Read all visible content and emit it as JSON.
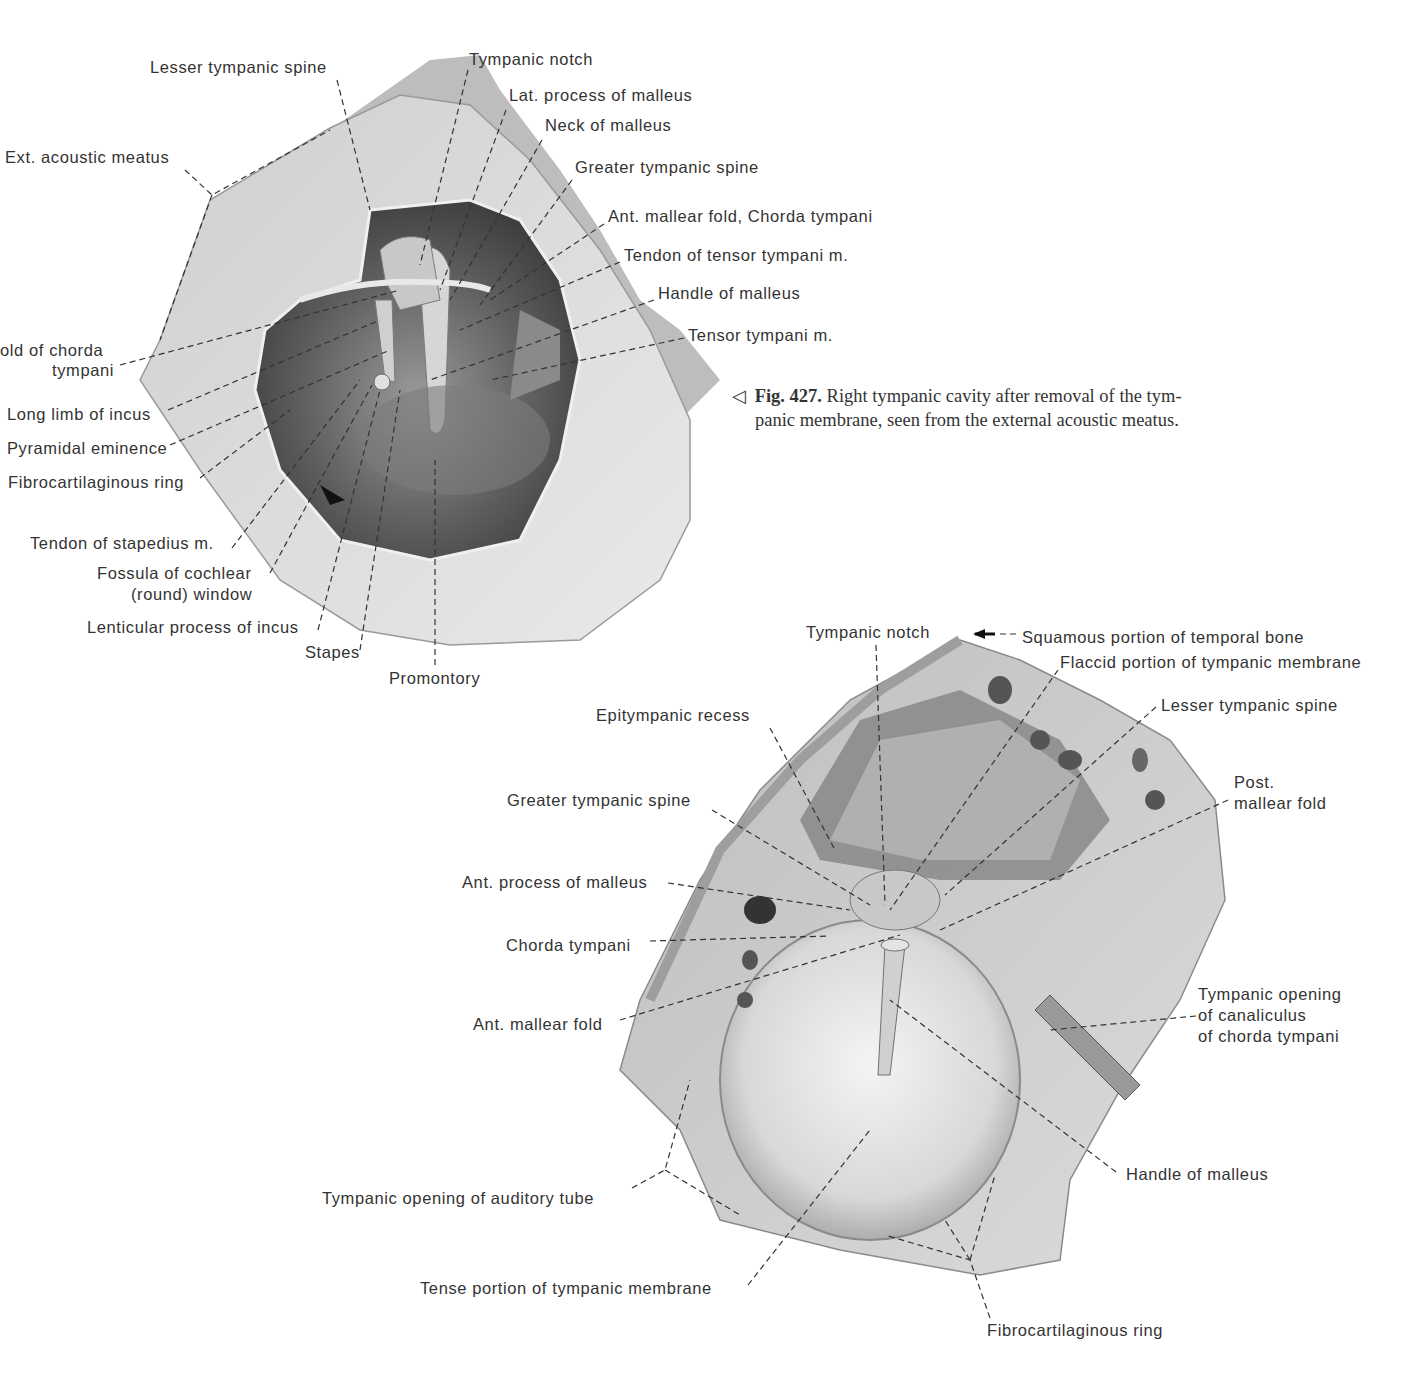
{
  "figure_caption": {
    "marker": "◁",
    "number": "Fig. 427.",
    "line1": "Right tympanic cavity after removal of the tym-",
    "line2": "panic membrane, seen from the external acoustic meatus."
  },
  "figure_top": {
    "title": "Right tympanic cavity (tympanic membrane removed)",
    "labels": [
      {
        "id": "lesser-tympanic-spine",
        "text": "Lesser tympanic spine",
        "x": 150,
        "y": 57
      },
      {
        "id": "tympanic-notch",
        "text": "Tympanic notch",
        "x": 469,
        "y": 49
      },
      {
        "id": "lat-process-malleus",
        "text": "Lat. process of malleus",
        "x": 509,
        "y": 85
      },
      {
        "id": "neck-malleus",
        "text": "Neck of malleus",
        "x": 545,
        "y": 115
      },
      {
        "id": "ext-acoustic-meatus",
        "text": "Ext. acoustic meatus",
        "x": 5,
        "y": 147
      },
      {
        "id": "greater-tympanic-spine",
        "text": "Greater tympanic spine",
        "x": 575,
        "y": 157
      },
      {
        "id": "ant-mallear-fold-chorda",
        "text": "Ant. mallear fold, Chorda tympani",
        "x": 608,
        "y": 206
      },
      {
        "id": "tendon-tensor-tympani",
        "text": "Tendon of tensor tympani m.",
        "x": 624,
        "y": 245
      },
      {
        "id": "handle-malleus",
        "text": "Handle of malleus",
        "x": 658,
        "y": 283
      },
      {
        "id": "tensor-tympani",
        "text": "Tensor tympani m.",
        "x": 688,
        "y": 325
      },
      {
        "id": "fold-chorda-1",
        "text": "old of chorda",
        "x": 0,
        "y": 340
      },
      {
        "id": "fold-chorda-2",
        "text": "tympani",
        "x": 52,
        "y": 360
      },
      {
        "id": "long-limb-incus",
        "text": "Long limb of incus",
        "x": 7,
        "y": 404
      },
      {
        "id": "pyramidal-eminence",
        "text": "Pyramidal eminence",
        "x": 7,
        "y": 438
      },
      {
        "id": "fibrocartilaginous-ring",
        "text": "Fibrocartilaginous ring",
        "x": 8,
        "y": 472
      },
      {
        "id": "tendon-stapedius",
        "text": "Tendon of stapedius m.",
        "x": 30,
        "y": 533
      },
      {
        "id": "fossula-cochlear-1",
        "text": "Fossula of cochlear",
        "x": 97,
        "y": 563
      },
      {
        "id": "fossula-cochlear-2",
        "text": "(round) window",
        "x": 131,
        "y": 584
      },
      {
        "id": "lenticular-process",
        "text": "Lenticular process of incus",
        "x": 87,
        "y": 617
      },
      {
        "id": "stapes",
        "text": "Stapes",
        "x": 305,
        "y": 642
      },
      {
        "id": "promontory",
        "text": "Promontory",
        "x": 389,
        "y": 668
      }
    ]
  },
  "figure_bottom": {
    "title": "Right tympanic membrane, lateral view",
    "labels": [
      {
        "id": "tympanic-notch",
        "text": "Tympanic notch",
        "x": 806,
        "y": 622
      },
      {
        "id": "squamous-portion",
        "text": "Squamous portion of temporal bone",
        "x": 1022,
        "y": 627
      },
      {
        "id": "flaccid-portion",
        "text": "Flaccid portion of tympanic membrane",
        "x": 1060,
        "y": 652
      },
      {
        "id": "lesser-tympanic-spine",
        "text": "Lesser tympanic spine",
        "x": 1161,
        "y": 695
      },
      {
        "id": "epitympanic-recess",
        "text": "Epitympanic recess",
        "x": 596,
        "y": 705
      },
      {
        "id": "post-mallear-fold-1",
        "text": "Post.",
        "x": 1234,
        "y": 772
      },
      {
        "id": "post-mallear-fold-2",
        "text": "mallear fold",
        "x": 1234,
        "y": 793
      },
      {
        "id": "greater-tympanic-spine",
        "text": "Greater tympanic spine",
        "x": 507,
        "y": 790
      },
      {
        "id": "ant-process-malleus",
        "text": "Ant. process of malleus",
        "x": 462,
        "y": 872
      },
      {
        "id": "chorda-tympani",
        "text": "Chorda tympani",
        "x": 506,
        "y": 935
      },
      {
        "id": "tympanic-opening-canaliculus-1",
        "text": "Tympanic opening",
        "x": 1198,
        "y": 984
      },
      {
        "id": "tympanic-opening-canaliculus-2",
        "text": "of canaliculus",
        "x": 1198,
        "y": 1005
      },
      {
        "id": "tympanic-opening-canaliculus-3",
        "text": "of chorda tympani",
        "x": 1198,
        "y": 1026
      },
      {
        "id": "ant-mallear-fold",
        "text": "Ant. mallear fold",
        "x": 473,
        "y": 1014
      },
      {
        "id": "handle-malleus",
        "text": "Handle of malleus",
        "x": 1126,
        "y": 1164
      },
      {
        "id": "tympanic-opening-auditory-tube",
        "text": "Tympanic opening of auditory tube",
        "x": 322,
        "y": 1188
      },
      {
        "id": "tense-portion",
        "text": "Tense portion of tympanic membrane",
        "x": 420,
        "y": 1278
      },
      {
        "id": "fibrocartilaginous-ring",
        "text": "Fibrocartilaginous ring",
        "x": 987,
        "y": 1320
      }
    ]
  }
}
